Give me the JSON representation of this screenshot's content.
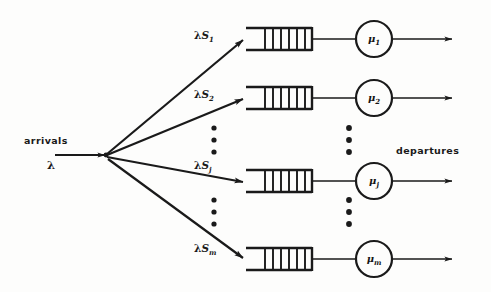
{
  "figure": {
    "type": "queueing-network-diagram"
  },
  "labels": {
    "arrivals_text": "arrivals",
    "arrivals_rate": "λ",
    "departures_text": "departures"
  },
  "branches": [
    {
      "id": "branch-1",
      "rate_base": "λS",
      "rate_subscript": "1",
      "rate_label": "λS₁",
      "server_base": "μ",
      "server_subscript": "1",
      "server_label": "μ₁",
      "queue_cells": 6
    },
    {
      "id": "branch-2",
      "rate_base": "λS",
      "rate_subscript": "2",
      "rate_label": "λS₂",
      "server_base": "μ",
      "server_subscript": "2",
      "server_label": "μ₂",
      "queue_cells": 6
    },
    {
      "id": "branch-j",
      "rate_base": "λS",
      "rate_subscript": "j",
      "rate_label": "λSⱼ",
      "server_base": "μ",
      "server_subscript": "j",
      "server_label": "μⱼ",
      "queue_cells": 6
    },
    {
      "id": "branch-m",
      "rate_base": "λS",
      "rate_subscript": "m",
      "rate_label": "λSₘ",
      "server_base": "μ",
      "server_subscript": "m",
      "server_label": "μₘ",
      "queue_cells": 6
    }
  ],
  "ellipses": [
    {
      "id": "ellipsis-branch-upper",
      "dots": 3
    },
    {
      "id": "ellipsis-branch-lower",
      "dots": 3
    },
    {
      "id": "ellipsis-server-upper",
      "dots": 3
    },
    {
      "id": "ellipsis-server-lower",
      "dots": 3
    }
  ],
  "colors": {
    "ink": "#1a1a1a",
    "background": "#fdfdfc"
  }
}
